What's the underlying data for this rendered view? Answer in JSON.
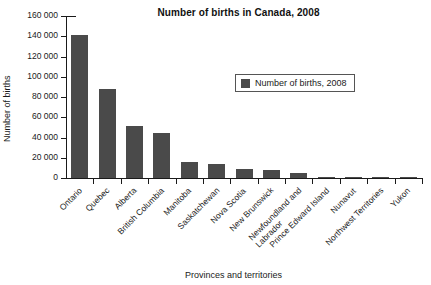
{
  "chart_data": {
    "type": "bar",
    "title": "Number of births in Canada, 2008",
    "xlabel": "Provinces and territories",
    "ylabel": "Number of births",
    "ylim": [
      0,
      160000
    ],
    "ytick_step": 20000,
    "ytick_labels": [
      "0",
      "20 000",
      "40 000",
      "60 000",
      "80 000",
      "100 000",
      "120 000",
      "140 000",
      "160 000"
    ],
    "ytick_values": [
      0,
      20000,
      40000,
      60000,
      80000,
      100000,
      120000,
      140000,
      160000
    ],
    "grid": false,
    "legend_position": "upper right inside",
    "legend": [
      "Number of births, 2008"
    ],
    "bar_color": "#4a4a4a",
    "categories": [
      "Ontario",
      "Quebec",
      "Alberta",
      "British Columbia",
      "Manitoba",
      "Saskatchewan",
      "Nova Scotia",
      "New Brunswick",
      "Newfoundland and\nLabrador",
      "Prince Edward Island",
      "Nunavut",
      "Northwest Territories",
      "Yukon"
    ],
    "series": [
      {
        "name": "Number of births, 2008",
        "values": [
          141000,
          87500,
          51000,
          44000,
          16000,
          14000,
          9000,
          7500,
          4800,
          1400,
          750,
          700,
          400
        ]
      }
    ]
  },
  "legend": {
    "entry_label": "Number of births, 2008"
  }
}
